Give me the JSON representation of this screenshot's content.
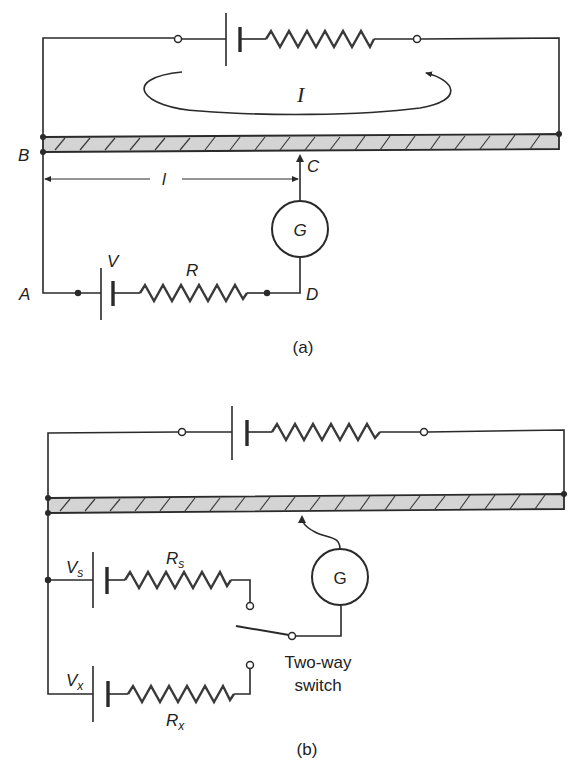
{
  "figure_a": {
    "caption": "(a)",
    "current_label": "I",
    "node_labels": {
      "A": "A",
      "B": "B",
      "C": "C",
      "D": "D"
    },
    "length_label": "l",
    "galvanometer_label": "G",
    "battery_label": "V",
    "resistor_label": "R"
  },
  "figure_b": {
    "caption": "(b)",
    "galvanometer_label": "G",
    "standard_cell": {
      "voltage": "V",
      "voltage_sub": "s",
      "resistor": "R",
      "resistor_sub": "s"
    },
    "unknown_cell": {
      "voltage": "V",
      "voltage_sub": "x",
      "resistor": "R",
      "resistor_sub": "x"
    },
    "switch_label_line1": "Two-way",
    "switch_label_line2": "switch"
  }
}
